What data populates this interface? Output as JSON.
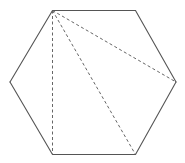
{
  "diagram": {
    "type": "regular-hexagon-with-diagonals",
    "shape": "hexagon",
    "vertices": [
      "top-left",
      "top-right",
      "right",
      "bottom-right",
      "bottom-left",
      "left"
    ],
    "outline_style": "solid",
    "diagonals": [
      {
        "from": "top-left",
        "to": "right",
        "style": "dashed"
      },
      {
        "from": "top-left",
        "to": "bottom-right",
        "style": "dashed"
      },
      {
        "from": "top-left",
        "to": "bottom-left",
        "style": "dashed"
      }
    ],
    "colors": {
      "background": "#ffffff",
      "outline": "#555555",
      "diagonal": "#666666"
    },
    "labels": []
  }
}
